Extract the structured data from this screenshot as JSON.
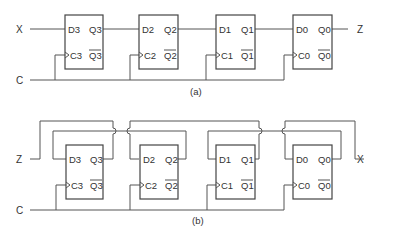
{
  "diagram_a": {
    "caption": "(a)",
    "input_label": "X",
    "output_label": "Z",
    "clock_label": "C",
    "flipflops": [
      {
        "d": "D3",
        "q": "Q3",
        "c": "C3",
        "qbar": "Q3"
      },
      {
        "d": "D2",
        "q": "Q2",
        "c": "C2",
        "qbar": "Q2"
      },
      {
        "d": "D1",
        "q": "Q1",
        "c": "C1",
        "qbar": "Q1"
      },
      {
        "d": "D0",
        "q": "Q0",
        "c": "C0",
        "qbar": "Q0"
      }
    ]
  },
  "diagram_b": {
    "caption": "(b)",
    "input_label": "Z",
    "output_label": "X",
    "clock_label": "C",
    "flipflops": [
      {
        "d": "D3",
        "q": "Q3",
        "c": "C3",
        "qbar": "Q3"
      },
      {
        "d": "D2",
        "q": "Q2",
        "c": "C2",
        "qbar": "Q2"
      },
      {
        "d": "D1",
        "q": "Q1",
        "c": "C1",
        "qbar": "Q1"
      },
      {
        "d": "D0",
        "q": "Q0",
        "c": "C0",
        "qbar": "Q0"
      }
    ]
  },
  "colors": {
    "line": "#555555",
    "text": "#333333",
    "background": "#ffffff"
  }
}
